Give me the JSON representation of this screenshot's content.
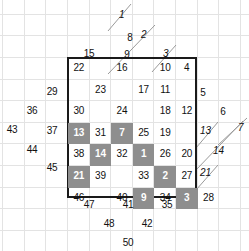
{
  "figure": {
    "kind": "numbered-lattice-diagram",
    "background_color": "#ffffff",
    "grid_line_color": "#e3e3e3",
    "box_border_color": "#1a1a1a",
    "shaded_cell_color": "#8e8e8e",
    "shaded_text_color": "#ffffff",
    "text_color": "#111111",
    "grid_cell_size": 21.6,
    "box": {
      "x": 67,
      "y": 57,
      "width": 130,
      "height": 141
    }
  },
  "diagonals": [
    {
      "label": "1",
      "label_x": 119,
      "label_y": 10,
      "x1": 108,
      "y1": 31,
      "x2": 131,
      "y2": 4
    },
    {
      "label": "2",
      "label_x": 141,
      "label_y": 30,
      "x1": 108,
      "y1": 74,
      "x2": 155,
      "y2": 25
    },
    {
      "label": "3",
      "label_x": 163,
      "label_y": 49,
      "x1": 152,
      "y1": 72,
      "x2": 176,
      "y2": 45
    },
    {
      "label": "13",
      "label_x": 200,
      "label_y": 126,
      "x1": 196,
      "y1": 148,
      "x2": 218,
      "y2": 122
    },
    {
      "label": "7",
      "label_x": 238,
      "label_y": 123,
      "x1": 218,
      "y1": 145,
      "x2": 247,
      "y2": 118
    },
    {
      "label": "14",
      "label_x": 213,
      "label_y": 146,
      "x1": 196,
      "y1": 170,
      "x2": 243,
      "y2": 121
    },
    {
      "label": "21",
      "label_x": 200,
      "label_y": 168,
      "x1": 196,
      "y1": 190,
      "x2": 218,
      "y2": 165
    }
  ],
  "box_rows": [
    {
      "row": 0,
      "cells": [
        {
          "col": 0,
          "value": "22",
          "shaded": false
        },
        {
          "col": 1,
          "value": "",
          "shaded": false
        },
        {
          "col": 2,
          "value": "16",
          "shaded": false
        },
        {
          "col": 3,
          "value": "",
          "shaded": false
        },
        {
          "col": 4,
          "value": "10",
          "shaded": false
        },
        {
          "col": 5,
          "value": "4",
          "shaded": false
        }
      ]
    },
    {
      "row": 1,
      "cells": [
        {
          "col": 0,
          "value": "",
          "shaded": false
        },
        {
          "col": 1,
          "value": "23",
          "shaded": false
        },
        {
          "col": 2,
          "value": "",
          "shaded": false
        },
        {
          "col": 3,
          "value": "17",
          "shaded": false
        },
        {
          "col": 4,
          "value": "11",
          "shaded": false
        },
        {
          "col": 5,
          "value": "",
          "shaded": false
        }
      ]
    },
    {
      "row": 2,
      "cells": [
        {
          "col": 0,
          "value": "30",
          "shaded": false
        },
        {
          "col": 1,
          "value": "",
          "shaded": false
        },
        {
          "col": 2,
          "value": "24",
          "shaded": false
        },
        {
          "col": 3,
          "value": "",
          "shaded": false
        },
        {
          "col": 4,
          "value": "18",
          "shaded": false
        },
        {
          "col": 5,
          "value": "12",
          "shaded": false
        }
      ]
    },
    {
      "row": 3,
      "cells": [
        {
          "col": 0,
          "value": "13",
          "shaded": true
        },
        {
          "col": 1,
          "value": "31",
          "shaded": false
        },
        {
          "col": 2,
          "value": "7",
          "shaded": true
        },
        {
          "col": 3,
          "value": "25",
          "shaded": false
        },
        {
          "col": 4,
          "value": "19",
          "shaded": false
        },
        {
          "col": 5,
          "value": "",
          "shaded": false
        }
      ]
    },
    {
      "row": 4,
      "cells": [
        {
          "col": 0,
          "value": "38",
          "shaded": false
        },
        {
          "col": 1,
          "value": "14",
          "shaded": true
        },
        {
          "col": 2,
          "value": "32",
          "shaded": false
        },
        {
          "col": 3,
          "value": "1",
          "shaded": true
        },
        {
          "col": 4,
          "value": "26",
          "shaded": false
        },
        {
          "col": 5,
          "value": "20",
          "shaded": false
        }
      ]
    },
    {
      "row": 5,
      "cells": [
        {
          "col": 0,
          "value": "21",
          "shaded": true
        },
        {
          "col": 1,
          "value": "39",
          "shaded": false
        },
        {
          "col": 2,
          "value": "",
          "shaded": false
        },
        {
          "col": 3,
          "value": "33",
          "shaded": false
        },
        {
          "col": 4,
          "value": "2",
          "shaded": true
        },
        {
          "col": 5,
          "value": "27",
          "shaded": false
        }
      ]
    },
    {
      "row": 6,
      "cells": [
        {
          "col": 0,
          "value": "46",
          "shaded": false
        },
        {
          "col": 1,
          "value": "",
          "shaded": false
        },
        {
          "col": 2,
          "value": "40",
          "shaded": false
        },
        {
          "col": 3,
          "value": "9",
          "shaded": true
        },
        {
          "col": 4,
          "value": "34",
          "shaded": false
        },
        {
          "col": 5,
          "value": "3",
          "shaded": true
        },
        {
          "col": 6,
          "value": "28",
          "shaded": false
        }
      ]
    }
  ],
  "outside_numbers": [
    {
      "value": "8",
      "x": 130,
      "y": 33
    },
    {
      "value": "15",
      "x": 89,
      "y": 49
    },
    {
      "value": "9",
      "x": 127,
      "y": 50
    },
    {
      "value": "29",
      "x": 52,
      "y": 87
    },
    {
      "value": "36",
      "x": 32,
      "y": 106
    },
    {
      "value": "43",
      "x": 12,
      "y": 125
    },
    {
      "value": "37",
      "x": 52,
      "y": 126
    },
    {
      "value": "44",
      "x": 32,
      "y": 145
    },
    {
      "value": "45",
      "x": 52,
      "y": 163
    },
    {
      "value": "5",
      "x": 203,
      "y": 88
    },
    {
      "value": "6",
      "x": 223,
      "y": 107
    },
    {
      "value": "47",
      "x": 89,
      "y": 200
    },
    {
      "value": "41",
      "x": 128,
      "y": 200
    },
    {
      "value": "35",
      "x": 167,
      "y": 200
    },
    {
      "value": "48",
      "x": 109,
      "y": 219
    },
    {
      "value": "42",
      "x": 147,
      "y": 219
    },
    {
      "value": "50",
      "x": 128,
      "y": 238
    }
  ]
}
